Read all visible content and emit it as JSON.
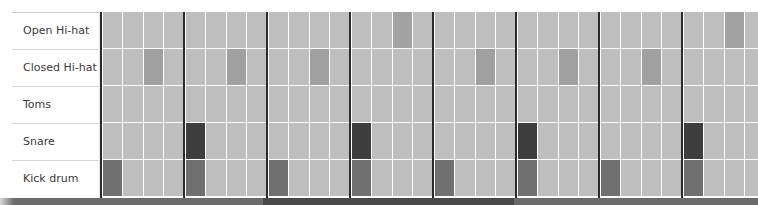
{
  "sequencer": {
    "bars": 8,
    "beats_per_bar": 4,
    "grid_left": 101,
    "bar_width": 83,
    "beat_width": 20.75,
    "row_height": 37,
    "colors": {
      "inactive": "#bebebe",
      "kick": "#6f6f6f",
      "snare": "#3e3e3e",
      "closed_hihat": "#a0a0a0",
      "open_hihat": "#a2a2a2",
      "toms": "#808080",
      "barline": "#2b2b2b",
      "gap": "#ffffff"
    },
    "tracks": [
      {
        "id": "open",
        "label": "Open Hi-hat",
        "steps": [
          0,
          0,
          0,
          0,
          0,
          0,
          0,
          0,
          0,
          0,
          0,
          0,
          0,
          0,
          1,
          0,
          0,
          0,
          0,
          0,
          0,
          0,
          0,
          0,
          0,
          0,
          0,
          0,
          0,
          0,
          1,
          0
        ]
      },
      {
        "id": "closed",
        "label": "Closed Hi-hat",
        "steps": [
          0,
          0,
          1,
          0,
          0,
          0,
          1,
          0,
          0,
          0,
          1,
          0,
          0,
          0,
          0,
          0,
          0,
          0,
          1,
          0,
          0,
          0,
          1,
          0,
          0,
          0,
          1,
          0,
          0,
          0,
          0,
          0
        ]
      },
      {
        "id": "toms",
        "label": "Toms",
        "steps": [
          0,
          0,
          0,
          0,
          0,
          0,
          0,
          0,
          0,
          0,
          0,
          0,
          0,
          0,
          0,
          0,
          0,
          0,
          0,
          0,
          0,
          0,
          0,
          0,
          0,
          0,
          0,
          0,
          0,
          0,
          0,
          0
        ]
      },
      {
        "id": "snare",
        "label": "Snare",
        "steps": [
          0,
          0,
          0,
          0,
          1,
          0,
          0,
          0,
          0,
          0,
          0,
          0,
          1,
          0,
          0,
          0,
          0,
          0,
          0,
          0,
          1,
          0,
          0,
          0,
          0,
          0,
          0,
          0,
          1,
          0,
          0,
          0
        ]
      },
      {
        "id": "kick",
        "label": "Kick drum",
        "steps": [
          1,
          0,
          0,
          0,
          1,
          0,
          0,
          0,
          1,
          0,
          0,
          0,
          1,
          0,
          0,
          0,
          1,
          0,
          0,
          0,
          1,
          0,
          0,
          0,
          1,
          0,
          0,
          0,
          1,
          0,
          0,
          0
        ]
      }
    ]
  },
  "bottom_strip": {
    "color": "#6b6b6b",
    "dark_segment": {
      "left": 263,
      "width": 251,
      "color": "#494949"
    }
  }
}
